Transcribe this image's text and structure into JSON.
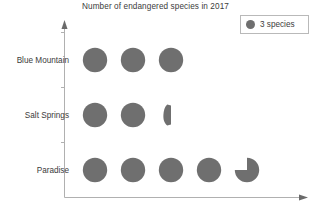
{
  "chart": {
    "title": "Number of endangered species in 2017"
  },
  "legend": {
    "swatch_icon": "gray-circle-icon",
    "label": "3 species",
    "color": "#6f6f6f"
  },
  "axes": {
    "y_axis_name": "category-axis",
    "x_axis_name": "value-axis",
    "line_color": "#b0b0b0",
    "has_arrowheads": true,
    "tick_count": 3
  },
  "chart_data": {
    "type": "table",
    "subtype": "pictograph",
    "title": "Number of endangered species in 2017",
    "xlabel": "",
    "ylabel": "",
    "symbol_value": 3,
    "symbol_unit": "species",
    "legend": [
      "3 species"
    ],
    "grid": false,
    "legend_position": "top-right",
    "categories": [
      "Blue Mountain",
      "Salt Springs",
      "Paradise"
    ],
    "values": [
      9,
      6.4,
      14.25
    ],
    "symbols": [
      {
        "category": "Blue Mountain",
        "full": 3,
        "partial": 0,
        "total_symbols": 3,
        "value": 9
      },
      {
        "category": "Salt Springs",
        "full": 2,
        "partial": 0.125,
        "total_symbols": 2.125,
        "value": 6.4
      },
      {
        "category": "Paradise",
        "full": 4,
        "partial": 0.75,
        "total_symbols": 4.75,
        "value": 14.25
      }
    ]
  },
  "rows": [
    {
      "label": "Blue Mountain",
      "label_name": "category-label-blue-mountain",
      "row_name": "pictograph-row-blue-mountain",
      "full": 3,
      "partial": 0
    },
    {
      "label": "Salt Springs",
      "label_name": "category-label-salt-springs",
      "row_name": "pictograph-row-salt-springs",
      "full": 2,
      "partial": 0.125
    },
    {
      "label": "Paradise",
      "label_name": "category-label-paradise",
      "row_name": "pictograph-row-paradise",
      "full": 4,
      "partial": 0.75
    }
  ]
}
